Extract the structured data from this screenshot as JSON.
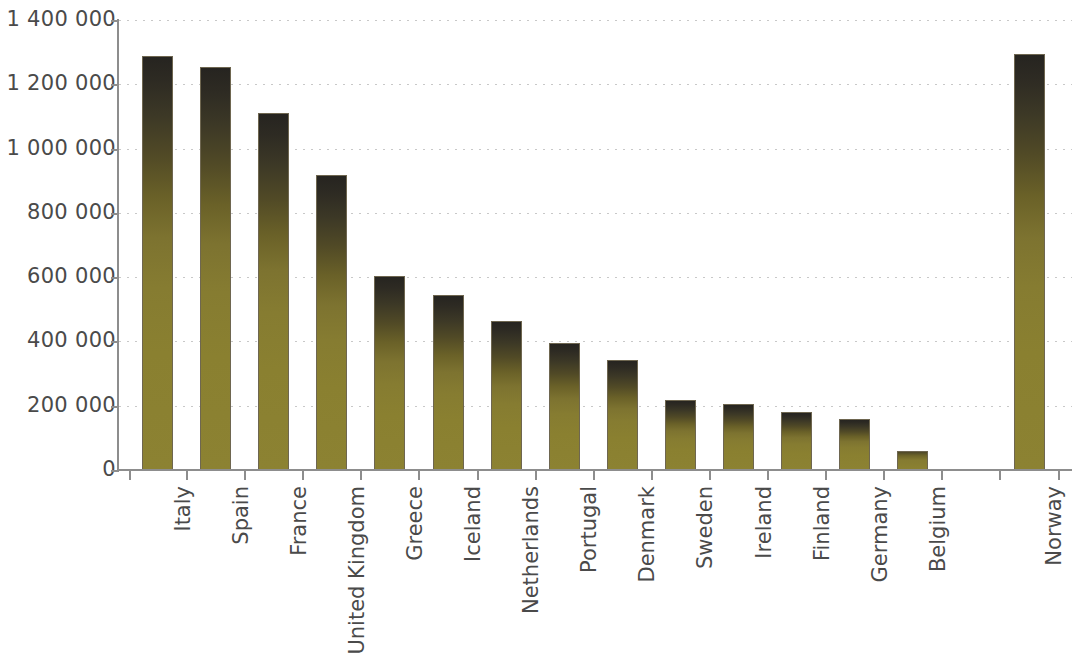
{
  "chart_data": {
    "type": "bar",
    "title": "",
    "subtitle": "",
    "xlabel": "",
    "ylabel": "",
    "categories": [
      "Italy",
      "Spain",
      "France",
      "United Kingdom",
      "Greece",
      "Iceland",
      "Netherlands",
      "Portugal",
      "Denmark",
      "Sweden",
      "Ireland",
      "Finland",
      "Germany",
      "Belgium",
      "",
      "Norway"
    ],
    "values": [
      1288000,
      1255000,
      1110000,
      917000,
      604000,
      543000,
      463000,
      396000,
      341000,
      218000,
      205000,
      181000,
      158000,
      60000,
      null,
      1293000
    ],
    "ylim": [
      0,
      1400000
    ],
    "ytick_values": [
      0,
      200000,
      400000,
      600000,
      800000,
      1000000,
      1200000,
      1400000
    ],
    "ytick_labels": [
      "0",
      "200 000",
      "400 000",
      "600 000",
      "800 000",
      "1 000 000",
      "1 200 000",
      "1 400 000"
    ],
    "grid": true,
    "grid_axis": "y",
    "grid_style": "dotted",
    "legend": null,
    "legend_position": "none",
    "bar_color_top": "#262420",
    "bar_color_bottom": "#8a8030",
    "bar_edge_color": "#6e6650",
    "axis_color": "#8d8d8d",
    "grid_color": "#c8c8c8",
    "text_color": "#4a4a4a",
    "background_color": "#ffffff",
    "note": "Gap (empty category slot) between Belgium and Norway"
  }
}
